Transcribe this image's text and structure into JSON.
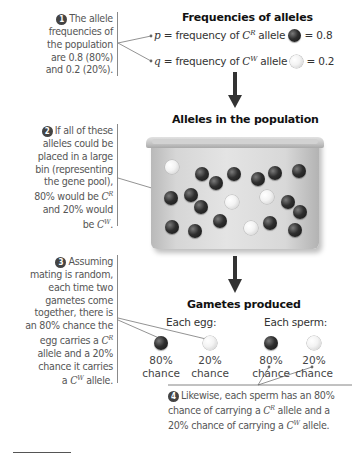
{
  "notes": {
    "step1": {
      "number": "1",
      "lines": [
        "The allele",
        "frequencies of",
        "the population",
        "are 0.8 (80%)",
        "and 0.2 (20%)."
      ]
    },
    "step2": {
      "number": "2",
      "lines": [
        "If all of these",
        "alleles could be",
        "placed in a large",
        "bin (representing",
        "the gene pool),",
        "80% would be",
        "and 20% would",
        "be"
      ],
      "allele_R": "C",
      "sup_R": "R",
      "allele_W": "C",
      "sup_W": "W"
    },
    "step3": {
      "number": "3",
      "lines": [
        "Assuming",
        "mating is random,",
        "each time two",
        "gametes come",
        "together, there is",
        "an 80% chance the",
        "egg carries a",
        "allele and a 20%",
        "chance it carries",
        "a",
        "allele."
      ],
      "allele_R": "C",
      "sup_R": "R",
      "allele_W": "C",
      "sup_W": "W"
    },
    "step4": {
      "number": "4",
      "line1": "Likewise, each sperm has an 80%",
      "line2a": "chance of carrying a",
      "line2b": "allele and a",
      "line3a": "20% chance of carrying a",
      "line3b": "allele.",
      "allele": "C",
      "sup_R": "R",
      "sup_W": "W"
    }
  },
  "frequencies": {
    "title": "Frequencies of alleles",
    "p": {
      "symbol": "p",
      "text": "= frequency of",
      "allele": "C",
      "sup": "R",
      "word": "allele",
      "value": "= 0.8"
    },
    "q": {
      "symbol": "q",
      "text": "= frequency of",
      "allele": "C",
      "sup": "W",
      "word": "allele",
      "value": "= 0.2"
    }
  },
  "population": {
    "title": "Alleles in the population",
    "dark_count": 16,
    "light_count": 4
  },
  "gametes": {
    "title": "Gametes produced",
    "egg_label": "Each egg:",
    "sperm_label": "Each sperm:",
    "egg": [
      {
        "pct": "80%",
        "word": "chance",
        "type": "dark"
      },
      {
        "pct": "20%",
        "word": "chance",
        "type": "light"
      }
    ],
    "sperm": [
      {
        "pct": "80%",
        "word": "chance",
        "type": "dark"
      },
      {
        "pct": "20%",
        "word": "chance",
        "type": "light"
      }
    ]
  },
  "colors": {
    "dark_allele": "#222222",
    "light_allele": "#f2f2f2",
    "arrow": "#333333",
    "note_text": "#555555"
  }
}
